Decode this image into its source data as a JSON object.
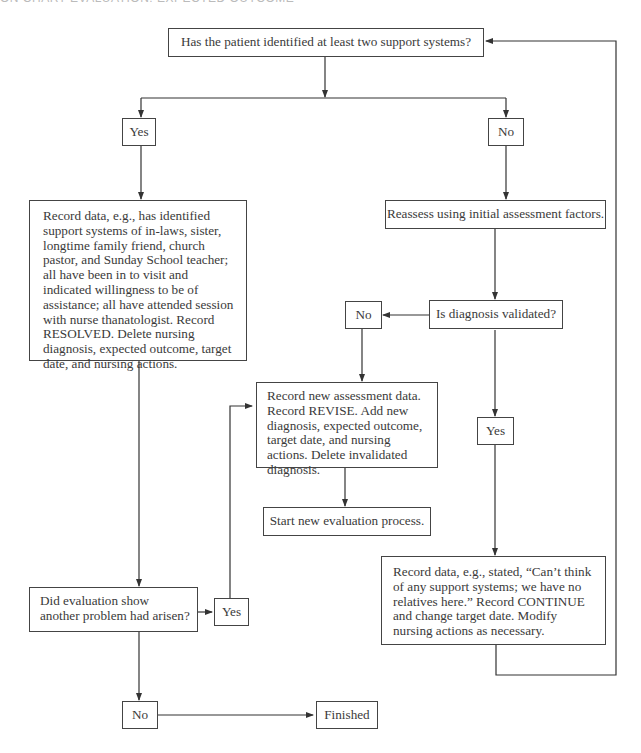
{
  "header": {
    "clipped_title": "ON CHART EVALUATION: EXPECTED OUTCOME"
  },
  "nodes": {
    "question_support": "Has the patient identified at least two support systems?",
    "yes_top": "Yes",
    "no_top": "No",
    "resolved": "Record data, e.g., has identified support systems of in-laws, sister, longtime family friend, church pastor, and Sunday School teacher; all have been in to visit and indicated willingness to be of assistance; all have attended session with nurse thanatologist. Record RESOLVED. Delete nursing diagnosis, expected outcome, target date, and nursing actions.",
    "reassess": "Reassess using initial assessment factors.",
    "question_validated": "Is diagnosis validated?",
    "no_validated": "No",
    "revise": "Record new assessment data. Record REVISE. Add new diagnosis, expected outcome, target date, and nursing actions. Delete invalidated diagnosis.",
    "start_new": "Start new evaluation process.",
    "yes_validated": "Yes",
    "continue": "Record data, e.g., stated, “Can’t think of any support systems; we have no relatives here.” Record CONTINUE and change target date. Modify nursing actions as necessary.",
    "question_problem": "Did evaluation show another problem had arisen?",
    "yes_problem": "Yes",
    "no_problem": "No",
    "finished": "Finished"
  },
  "colors": {
    "line": "#333333",
    "border": "#444444",
    "text": "#3a3a3a",
    "background": "#ffffff"
  }
}
